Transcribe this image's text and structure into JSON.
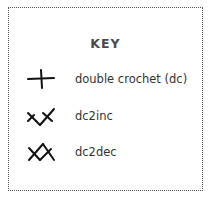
{
  "key": {
    "title": "KEY",
    "items": [
      {
        "symbol": "double-crochet-symbol",
        "label": "double crochet (dc)"
      },
      {
        "symbol": "dc2inc-symbol",
        "label": "dc2inc"
      },
      {
        "symbol": "dc2dec-symbol",
        "label": "dc2dec"
      }
    ]
  },
  "colors": {
    "symbol": "#111111",
    "text": "#333333",
    "title": "#4a4a4a",
    "border": "#555555",
    "background": "#ffffff"
  }
}
